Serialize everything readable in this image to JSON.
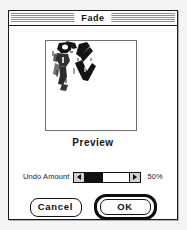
{
  "window": {
    "title": "Fade"
  },
  "preview": {
    "caption": "Preview",
    "image_alt": "ink-brush-figure-thumbnail"
  },
  "controls": {
    "undo_amount_label": "Undo Amount",
    "undo_amount_value": "50%",
    "undo_amount_percent": 50,
    "slider_left_arrow": "left-arrow",
    "slider_right_arrow": "right-arrow"
  },
  "buttons": {
    "cancel_label": "Cancel",
    "ok_label": "OK",
    "default_button": "OK"
  },
  "colors": {
    "window_background": "#ffffff",
    "page_background": "#f4f4f4",
    "border": "#1a1a1a",
    "titlebar_stripe": "#8e8e8e",
    "slider_fill": "#111111",
    "text": "#121212"
  }
}
